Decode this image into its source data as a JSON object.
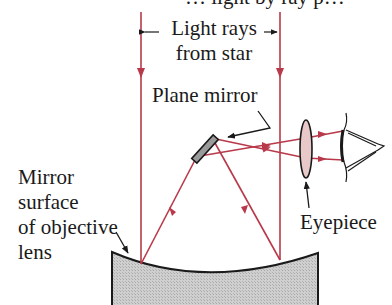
{
  "diagram": {
    "type": "reflecting-telescope",
    "top_caption_partial": "… light by ray p…",
    "labels": {
      "rays_line1": "Light rays",
      "rays_line2": "from star",
      "plane_mirror": "Plane mirror",
      "objective_line1": "Mirror",
      "objective_line2": "surface",
      "objective_line3": "of objective",
      "objective_line4": "lens",
      "eyepiece": "Eyepiece"
    },
    "colors": {
      "ray": "#b8394a",
      "ink": "#1a1a1a",
      "mirror_fill": "#c8c8c8",
      "lens_fill": "#e8c8c8"
    }
  }
}
